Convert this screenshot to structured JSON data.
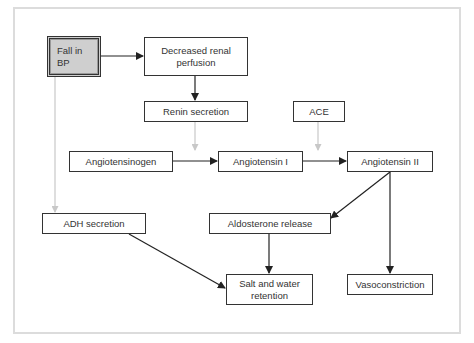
{
  "diagram": {
    "type": "flowchart",
    "nodes": {
      "fall_bp": "Fall in\nBP",
      "decreased_perfusion": "Decreased renal\nperfusion",
      "renin": "Renin secretion",
      "ace": "ACE",
      "angiotensinogen": "Angiotensinogen",
      "angiotensin_i": "Angiotensin I",
      "angiotensin_ii": "Angiotensin II",
      "adh": "ADH secretion",
      "aldosterone": "Aldosterone release",
      "salt_water": "Salt and water\nretention",
      "vasoconstriction": "Vasoconstriction"
    },
    "edges": [
      {
        "from": "Fall in BP",
        "to": "Decreased renal perfusion",
        "style": "solid"
      },
      {
        "from": "Decreased renal perfusion",
        "to": "Renin secretion",
        "style": "solid"
      },
      {
        "from": "Renin secretion",
        "to": "Angiotensinogen→Angiotensin I",
        "style": "gray"
      },
      {
        "from": "ACE",
        "to": "Angiotensin I→Angiotensin II",
        "style": "gray"
      },
      {
        "from": "Angiotensinogen",
        "to": "Angiotensin I",
        "style": "solid"
      },
      {
        "from": "Angiotensin I",
        "to": "Angiotensin II",
        "style": "solid"
      },
      {
        "from": "Fall in BP",
        "to": "ADH secretion",
        "style": "gray"
      },
      {
        "from": "Angiotensin II",
        "to": "Aldosterone release",
        "style": "solid"
      },
      {
        "from": "Angiotensin II",
        "to": "Vasoconstriction",
        "style": "solid"
      },
      {
        "from": "ADH secretion",
        "to": "Salt and water retention",
        "style": "solid"
      },
      {
        "from": "Aldosterone release",
        "to": "Salt and water retention",
        "style": "solid"
      }
    ],
    "colors": {
      "line": "#333333",
      "gray_line": "#c8c8c8",
      "start_fill": "#cfcfcf",
      "frame": "#dcdcdc"
    }
  }
}
